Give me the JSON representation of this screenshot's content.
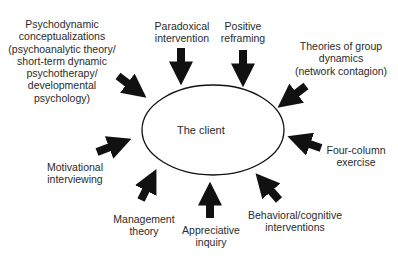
{
  "center": {
    "label": "The client"
  },
  "inputs": [
    {
      "id": "psychodynamic",
      "lines": [
        "Psychodynamic",
        "conceptualizations",
        "(psychoanalytic theory/",
        "short-term dynamic",
        "psychotherapy/",
        "developmental",
        "psychology)"
      ]
    },
    {
      "id": "paradoxical",
      "lines": [
        "Paradoxical",
        "intervention"
      ]
    },
    {
      "id": "positive",
      "lines": [
        "Positive",
        "reframing"
      ]
    },
    {
      "id": "group",
      "lines": [
        "Theories of group",
        "dynamics",
        "(network contagion)"
      ]
    },
    {
      "id": "fourcol",
      "lines": [
        "Four-column",
        "exercise"
      ]
    },
    {
      "id": "behavioral",
      "lines": [
        "Behavioral/cognitive",
        "interventions"
      ]
    },
    {
      "id": "appreciative",
      "lines": [
        "Appreciative",
        "inquiry"
      ]
    },
    {
      "id": "management",
      "lines": [
        "Management",
        "theory"
      ]
    },
    {
      "id": "motivational",
      "lines": [
        "Motivational",
        "interviewing"
      ]
    }
  ],
  "colors": {
    "arrow": "#111111",
    "ellipse_stroke": "#111111",
    "text": "#2a2a2a"
  }
}
